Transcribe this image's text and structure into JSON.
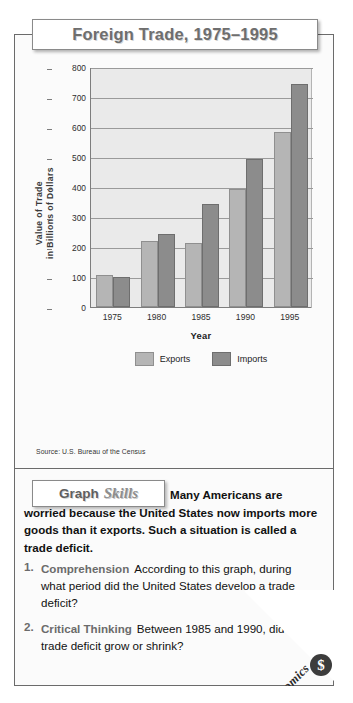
{
  "title": "Foreign Trade, 1975–1995",
  "source": "Source:  U.S. Bureau of the Census",
  "chart_data": {
    "type": "bar",
    "title": "Foreign Trade, 1975–1995",
    "xlabel": "Year",
    "ylabel": "Value of Trade\nin Billions of Dollars",
    "ylabel_line1": "Value of Trade",
    "ylabel_line2": "in Billions of Dollars",
    "categories": [
      "1975",
      "1980",
      "1985",
      "1990",
      "1995"
    ],
    "series": [
      {
        "name": "Exports",
        "color": "#b5b5b5",
        "values": [
          108,
          220,
          213,
          394,
          584
        ]
      },
      {
        "name": "Imports",
        "color": "#8c8c8c",
        "values": [
          100,
          245,
          345,
          495,
          744
        ]
      }
    ],
    "yticks": [
      0,
      100,
      200,
      300,
      400,
      500,
      600,
      700,
      800
    ],
    "ylim": [
      0,
      800
    ],
    "grid": true,
    "legend_position": "bottom",
    "units": "billions of dollars",
    "source": "U.S. Bureau of the Census"
  },
  "skills": {
    "label_graph": "Graph",
    "label_skills": "Skills",
    "intro": "Many Americans are worried because the United States now imports more goods than it exports. Such a situation is called a trade deficit."
  },
  "questions": [
    {
      "number": "1.",
      "term": "Comprehension",
      "text": "According to this graph, during what period did the United States develop a trade deficit?"
    },
    {
      "number": "2.",
      "term": "Critical Thinking",
      "text": "Between 1985 and 1990, did the trade deficit grow or shrink?"
    }
  ],
  "badge": {
    "label": "Economics",
    "icon": "$"
  }
}
